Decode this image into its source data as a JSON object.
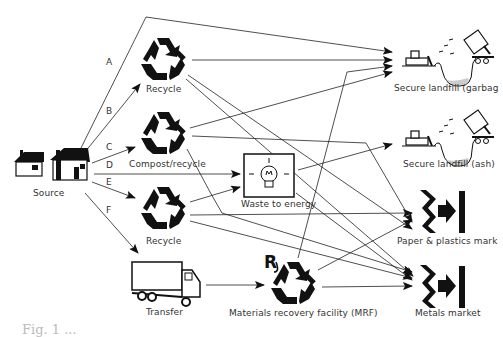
{
  "diagram": {
    "nodes": {
      "source": {
        "label": "Source"
      },
      "recycle_top": {
        "label": "Recycle"
      },
      "compost": {
        "label": "Compost/recycle"
      },
      "waste_to_energy": {
        "label": "Waste to energy"
      },
      "recycle_bottom": {
        "label": "Recycle"
      },
      "transfer": {
        "label": "Transfer"
      },
      "mrf": {
        "label": "Materials recovery facility (MRF)",
        "badge": "R"
      },
      "landfill_garbage": {
        "label": "Secure landfill (garbag"
      },
      "landfill_ash": {
        "label": "Secure landfill (ash)"
      },
      "paper_market": {
        "label": "Paper & plastics mark"
      },
      "metals_market": {
        "label": "Metals market"
      }
    },
    "routes": [
      {
        "id": "A",
        "label": "A"
      },
      {
        "id": "B",
        "label": "B"
      },
      {
        "id": "C",
        "label": "C"
      },
      {
        "id": "D",
        "label": "D"
      },
      {
        "id": "E",
        "label": "E"
      },
      {
        "id": "F",
        "label": "F"
      }
    ],
    "caption_fragment": "Fig. 1 ..."
  },
  "colors": {
    "ink": "#111111",
    "line": "#222222",
    "label": "#333333",
    "bg": "#ffffff"
  }
}
